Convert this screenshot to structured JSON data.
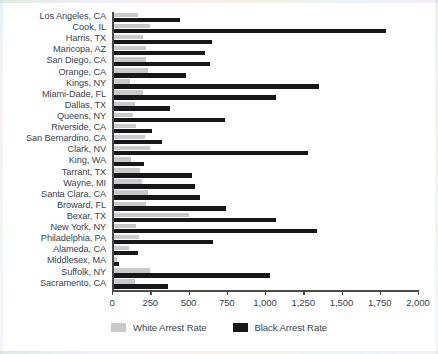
{
  "chart_data": {
    "type": "bar",
    "orientation": "horizontal",
    "title": "",
    "subtitle": "",
    "xlabel": "",
    "ylabel": "",
    "xlim": [
      0,
      2000
    ],
    "xticks": [
      0,
      250,
      500,
      750,
      1000,
      1250,
      1500,
      1750,
      2000
    ],
    "xtick_labels": [
      "0",
      "250",
      "500",
      "750",
      "1,000",
      "1,250",
      "1,500",
      "1,750",
      "2,000"
    ],
    "grid": false,
    "legend_position": "bottom",
    "categories": [
      "Los Angeles, CA",
      "Cook, IL",
      "Harris, TX",
      "Maricopa, AZ",
      "San Diego, CA",
      "Orange, CA",
      "Kings, NY",
      "Miami-Dade, FL",
      "Dallas, TX",
      "Queens, NY",
      "Riverside, CA",
      "San Bernardino, CA",
      "Clark, NV",
      "King, WA",
      "Tarrant, TX",
      "Wayne, MI",
      "Santa Clara, CA",
      "Broward, FL",
      "Bexar, TX",
      "New York, NY",
      "Philadelphia, PA",
      "Alameda, CA",
      "Middlesex, MA",
      "Suffolk, NY",
      "Sacramento, CA"
    ],
    "series": [
      {
        "name": "White Arrest Rate",
        "color": "#c9c9c9",
        "values": [
          170,
          250,
          205,
          220,
          225,
          235,
          120,
          205,
          150,
          140,
          155,
          215,
          250,
          125,
          180,
          195,
          235,
          225,
          500,
          160,
          175,
          110,
          35,
          250,
          150
        ]
      },
      {
        "name": "Black Arrest Rate",
        "color": "#17171a",
        "values": [
          445,
          1790,
          655,
          605,
          640,
          485,
          1350,
          1075,
          380,
          740,
          260,
          330,
          1280,
          210,
          525,
          540,
          575,
          745,
          1075,
          1340,
          660,
          170,
          45,
          1035,
          365
        ]
      }
    ],
    "legend": [
      {
        "label": "White Arrest Rate",
        "color": "#c9c9c9",
        "swatch": "white-swatch"
      },
      {
        "label": "Black Arrest Rate",
        "color": "#17171a",
        "swatch": "black-swatch"
      }
    ]
  }
}
